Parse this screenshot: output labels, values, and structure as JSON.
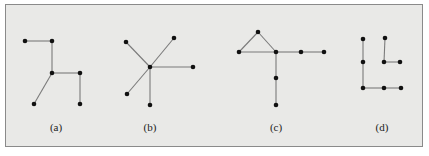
{
  "figure": {
    "background": "#e9e9e7",
    "border_color": "#8a8a8a",
    "edge_color": "#7a7a7a",
    "node_color": "#111111"
  },
  "graphs": [
    {
      "id": "a",
      "label": "(a)",
      "label_pos": [
        56,
        131
      ],
      "nodes": [
        [
          25,
          41
        ],
        [
          52,
          41
        ],
        [
          52,
          73
        ],
        [
          80,
          73
        ],
        [
          34,
          104
        ],
        [
          80,
          104
        ]
      ],
      "edges": [
        [
          0,
          1
        ],
        [
          1,
          2
        ],
        [
          2,
          3
        ],
        [
          2,
          4
        ],
        [
          3,
          5
        ]
      ]
    },
    {
      "id": "b",
      "label": "(b)",
      "label_pos": [
        150,
        131
      ],
      "nodes": [
        [
          126,
          42
        ],
        [
          174,
          38
        ],
        [
          150,
          67
        ],
        [
          193,
          67
        ],
        [
          127,
          94
        ],
        [
          150,
          105
        ]
      ],
      "edges": [
        [
          0,
          2
        ],
        [
          1,
          2
        ],
        [
          2,
          3
        ],
        [
          2,
          4
        ],
        [
          2,
          5
        ]
      ]
    },
    {
      "id": "c",
      "label": "(c)",
      "label_pos": [
        276,
        131
      ],
      "nodes": [
        [
          258,
          32
        ],
        [
          239,
          52
        ],
        [
          276,
          52
        ],
        [
          301,
          52
        ],
        [
          324,
          52
        ],
        [
          276,
          78
        ],
        [
          276,
          105
        ]
      ],
      "edges": [
        [
          0,
          1
        ],
        [
          0,
          2
        ],
        [
          1,
          2
        ],
        [
          2,
          3
        ],
        [
          3,
          4
        ],
        [
          2,
          5
        ],
        [
          5,
          6
        ]
      ]
    },
    {
      "id": "d",
      "label": "(d)",
      "label_pos": [
        382,
        131
      ],
      "nodes": [
        [
          363,
          39
        ],
        [
          385,
          38
        ],
        [
          363,
          62
        ],
        [
          384,
          62
        ],
        [
          400,
          62
        ],
        [
          363,
          88
        ],
        [
          384,
          88
        ],
        [
          401,
          88
        ]
      ],
      "edges": [
        [
          0,
          2
        ],
        [
          2,
          5
        ],
        [
          1,
          3
        ],
        [
          3,
          4
        ],
        [
          5,
          6
        ],
        [
          6,
          7
        ]
      ]
    }
  ]
}
